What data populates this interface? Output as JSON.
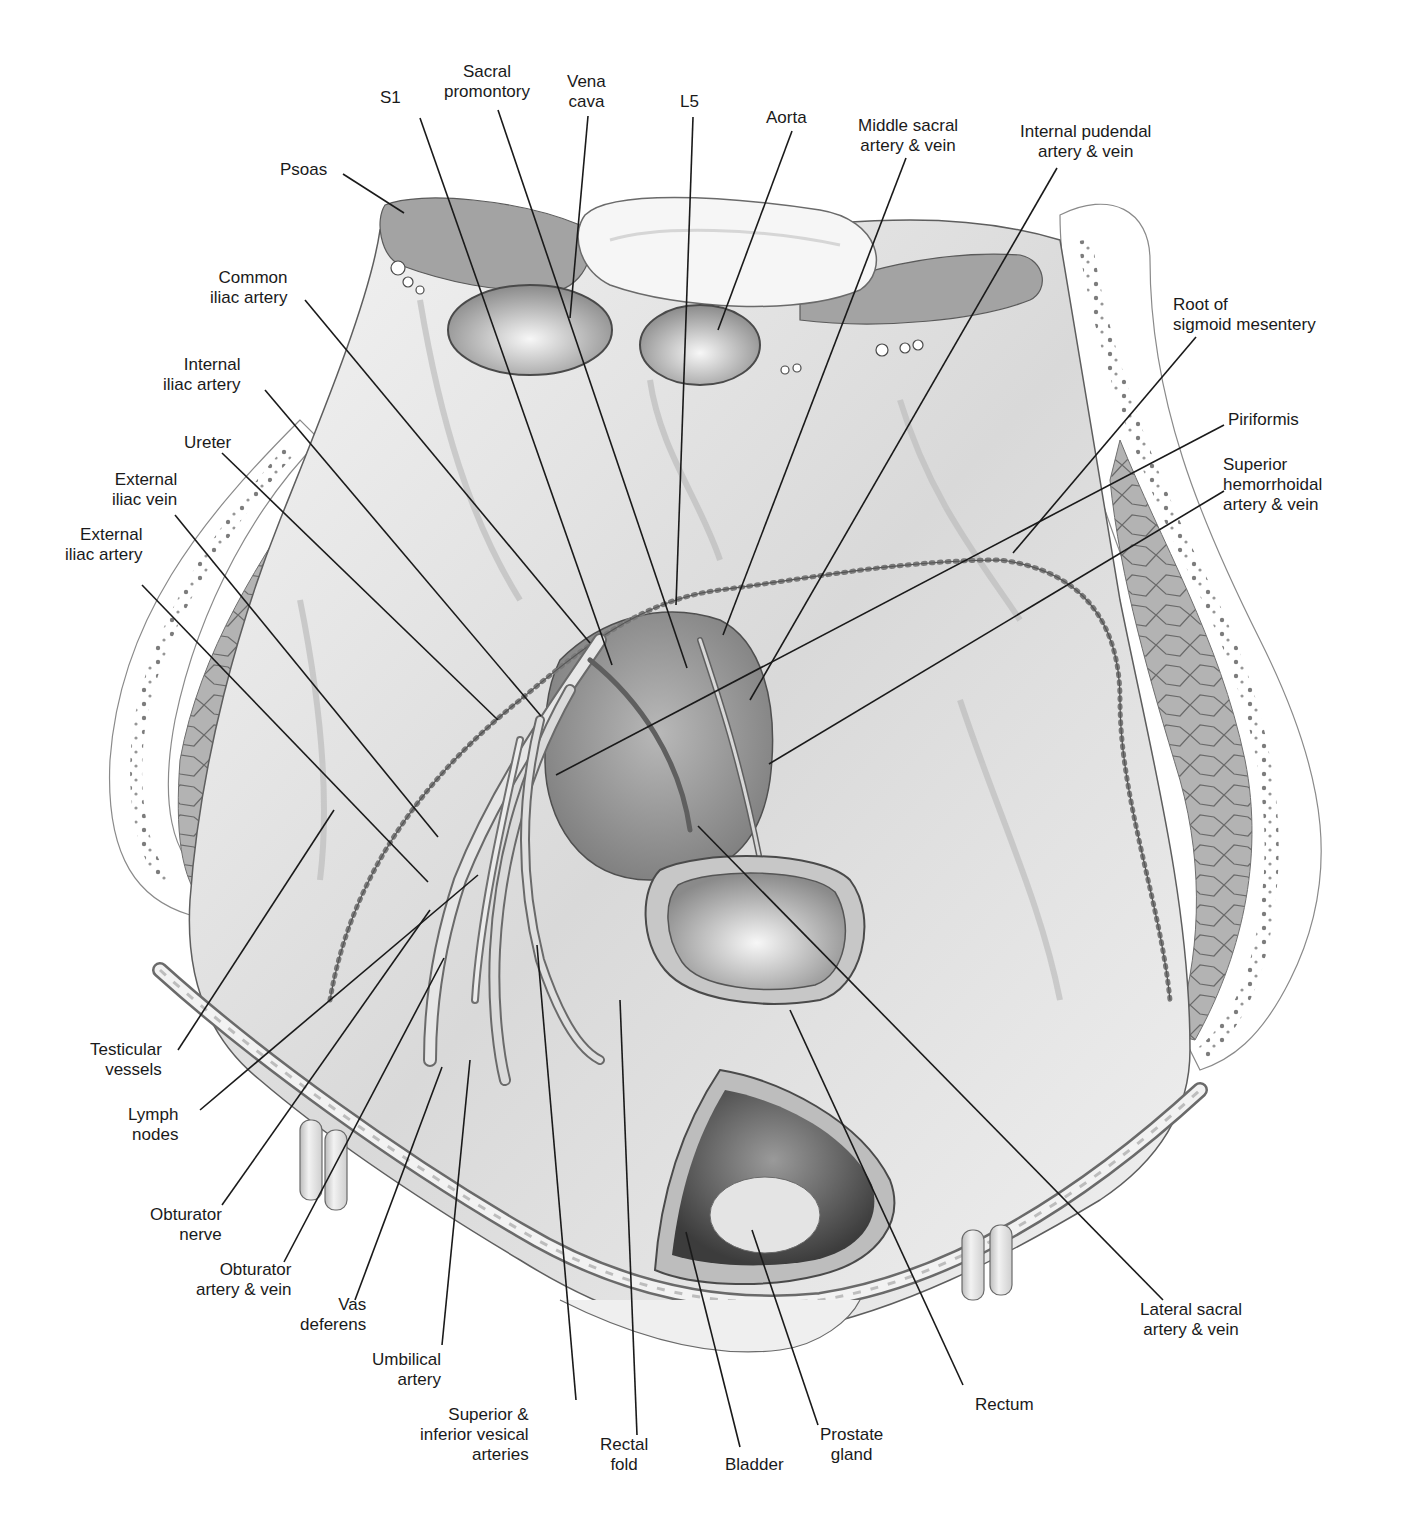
{
  "figure": {
    "colors": {
      "background": "#ffffff",
      "ink": "#1a1a1a",
      "tissue": "#e4e4e4",
      "muscle": "#a9a9a9",
      "fat_dots": "#6f6f6f",
      "lumen": "#8e8e8e"
    }
  },
  "labels": [
    {
      "id": "s1",
      "lines": [
        "S1"
      ],
      "x": 380,
      "y": 88,
      "align": "center",
      "point": [
        612,
        665
      ],
      "anchor": [
        420,
        118
      ]
    },
    {
      "id": "sacral-promontory",
      "lines": [
        "Sacral",
        "promontory"
      ],
      "x": 444,
      "y": 62,
      "align": "center",
      "point": [
        687,
        668
      ],
      "anchor": [
        498,
        110
      ]
    },
    {
      "id": "vena-cava",
      "lines": [
        "Vena",
        "cava"
      ],
      "x": 567,
      "y": 72,
      "align": "center",
      "point": [
        570,
        318
      ],
      "anchor": [
        588,
        116
      ]
    },
    {
      "id": "l5",
      "lines": [
        "L5"
      ],
      "x": 680,
      "y": 92,
      "align": "center",
      "point": [
        676,
        605
      ],
      "anchor": [
        693,
        117
      ]
    },
    {
      "id": "aorta",
      "lines": [
        "Aorta"
      ],
      "x": 766,
      "y": 108,
      "align": "center",
      "point": [
        718,
        330
      ],
      "anchor": [
        792,
        131
      ]
    },
    {
      "id": "middle-sacral",
      "lines": [
        "Middle sacral",
        "artery & vein"
      ],
      "x": 858,
      "y": 116,
      "align": "center",
      "point": [
        723,
        635
      ],
      "anchor": [
        906,
        158
      ]
    },
    {
      "id": "internal-pudendal",
      "lines": [
        "Internal pudendal",
        "artery & vein"
      ],
      "x": 1020,
      "y": 122,
      "align": "center",
      "point": [
        750,
        700
      ],
      "anchor": [
        1057,
        168
      ]
    },
    {
      "id": "psoas",
      "lines": [
        "Psoas"
      ],
      "x": 280,
      "y": 160,
      "align": "right",
      "point": [
        404,
        213
      ],
      "anchor": [
        343,
        174
      ]
    },
    {
      "id": "root-sigmoid",
      "lines": [
        "Root of",
        "sigmoid mesentery"
      ],
      "x": 1173,
      "y": 295,
      "align": "left",
      "point": [
        1013,
        553
      ],
      "anchor": [
        1196,
        337
      ]
    },
    {
      "id": "piriformis",
      "lines": [
        "Piriformis"
      ],
      "x": 1228,
      "y": 410,
      "align": "left",
      "point": [
        556,
        775
      ],
      "anchor": [
        1224,
        425
      ]
    },
    {
      "id": "sup-hemorrhoidal",
      "lines": [
        "Superior",
        "hemorrhoidal",
        "artery & vein"
      ],
      "x": 1223,
      "y": 455,
      "align": "left",
      "point": [
        769,
        764
      ],
      "anchor": [
        1224,
        491
      ]
    },
    {
      "id": "common-iliac",
      "lines": [
        "Common",
        "iliac artery"
      ],
      "x": 210,
      "y": 268,
      "align": "right",
      "point": [
        590,
        643
      ],
      "anchor": [
        305,
        300
      ]
    },
    {
      "id": "internal-iliac",
      "lines": [
        "Internal",
        "iliac artery"
      ],
      "x": 163,
      "y": 355,
      "align": "right",
      "point": [
        541,
        716
      ],
      "anchor": [
        265,
        390
      ]
    },
    {
      "id": "ureter",
      "lines": [
        "Ureter"
      ],
      "x": 184,
      "y": 433,
      "align": "right",
      "point": [
        498,
        720
      ],
      "anchor": [
        222,
        453
      ]
    },
    {
      "id": "ext-iliac-vein",
      "lines": [
        "External",
        "iliac vein"
      ],
      "x": 112,
      "y": 470,
      "align": "right",
      "point": [
        438,
        837
      ],
      "anchor": [
        175,
        515
      ]
    },
    {
      "id": "ext-iliac-artery",
      "lines": [
        "External",
        "iliac artery"
      ],
      "x": 65,
      "y": 525,
      "align": "right",
      "point": [
        428,
        882
      ],
      "anchor": [
        142,
        585
      ]
    },
    {
      "id": "testicular",
      "lines": [
        "Testicular",
        "vessels"
      ],
      "x": 90,
      "y": 1040,
      "align": "right",
      "point": [
        334,
        810
      ],
      "anchor": [
        178,
        1050
      ]
    },
    {
      "id": "lymph",
      "lines": [
        "Lymph",
        "nodes"
      ],
      "x": 128,
      "y": 1105,
      "align": "right",
      "point": [
        478,
        875
      ],
      "anchor": [
        200,
        1110
      ]
    },
    {
      "id": "obturator-nerve",
      "lines": [
        "Obturator",
        "nerve"
      ],
      "x": 150,
      "y": 1205,
      "align": "right",
      "point": [
        430,
        910
      ],
      "anchor": [
        222,
        1205
      ]
    },
    {
      "id": "obturator-artery",
      "lines": [
        "Obturator",
        "artery & vein"
      ],
      "x": 196,
      "y": 1260,
      "align": "right",
      "point": [
        444,
        958
      ],
      "anchor": [
        284,
        1262
      ]
    },
    {
      "id": "vas-deferens",
      "lines": [
        "Vas",
        "deferens"
      ],
      "x": 300,
      "y": 1295,
      "align": "right",
      "point": [
        442,
        1067
      ],
      "anchor": [
        355,
        1300
      ]
    },
    {
      "id": "umbilical",
      "lines": [
        "Umbilical",
        "artery"
      ],
      "x": 372,
      "y": 1350,
      "align": "right",
      "point": [
        470,
        1060
      ],
      "anchor": [
        442,
        1345
      ]
    },
    {
      "id": "vesical",
      "lines": [
        "Superior &",
        "inferior vesical",
        "arteries"
      ],
      "x": 420,
      "y": 1405,
      "align": "right",
      "point": [
        537,
        945
      ],
      "anchor": [
        576,
        1400
      ]
    },
    {
      "id": "rectal-fold",
      "lines": [
        "Rectal",
        "fold"
      ],
      "x": 600,
      "y": 1435,
      "align": "center",
      "point": [
        620,
        1000
      ],
      "anchor": [
        637,
        1435
      ]
    },
    {
      "id": "bladder",
      "lines": [
        "Bladder"
      ],
      "x": 725,
      "y": 1455,
      "align": "center",
      "point": [
        686,
        1232
      ],
      "anchor": [
        740,
        1447
      ]
    },
    {
      "id": "prostate",
      "lines": [
        "Prostate",
        "gland"
      ],
      "x": 820,
      "y": 1425,
      "align": "center",
      "point": [
        752,
        1230
      ],
      "anchor": [
        818,
        1425
      ]
    },
    {
      "id": "rectum",
      "lines": [
        "Rectum"
      ],
      "x": 975,
      "y": 1395,
      "align": "center",
      "point": [
        790,
        1010
      ],
      "anchor": [
        963,
        1385
      ]
    },
    {
      "id": "lateral-sacral",
      "lines": [
        "Lateral sacral",
        "artery & vein"
      ],
      "x": 1140,
      "y": 1300,
      "align": "center",
      "point": [
        698,
        826
      ],
      "anchor": [
        1163,
        1300
      ]
    }
  ],
  "labels_text": {
    "s1": "S1",
    "sacral_promontory": "Sacral promontory",
    "vena_cava": "Vena cava",
    "l5": "L5",
    "aorta": "Aorta",
    "middle_sacral": "Middle sacral artery & vein",
    "internal_pudendal": "Internal pudendal artery & vein",
    "psoas": "Psoas",
    "root_sigmoid": "Root of sigmoid mesentery",
    "piriformis": "Piriformis",
    "sup_hemorrhoidal": "Superior hemorrhoidal artery & vein",
    "common_iliac": "Common iliac artery",
    "internal_iliac": "Internal iliac artery",
    "ureter": "Ureter",
    "ext_iliac_vein": "External iliac vein",
    "ext_iliac_artery": "External iliac artery",
    "testicular": "Testicular vessels",
    "lymph": "Lymph nodes",
    "obturator_nerve": "Obturator nerve",
    "obturator_artery": "Obturator artery & vein",
    "vas_deferens": "Vas deferens",
    "umbilical": "Umbilical artery",
    "vesical": "Superior & inferior vesical arteries",
    "rectal_fold": "Rectal fold",
    "bladder": "Bladder",
    "prostate": "Prostate gland",
    "rectum": "Rectum",
    "lateral_sacral": "Lateral sacral artery & vein"
  }
}
